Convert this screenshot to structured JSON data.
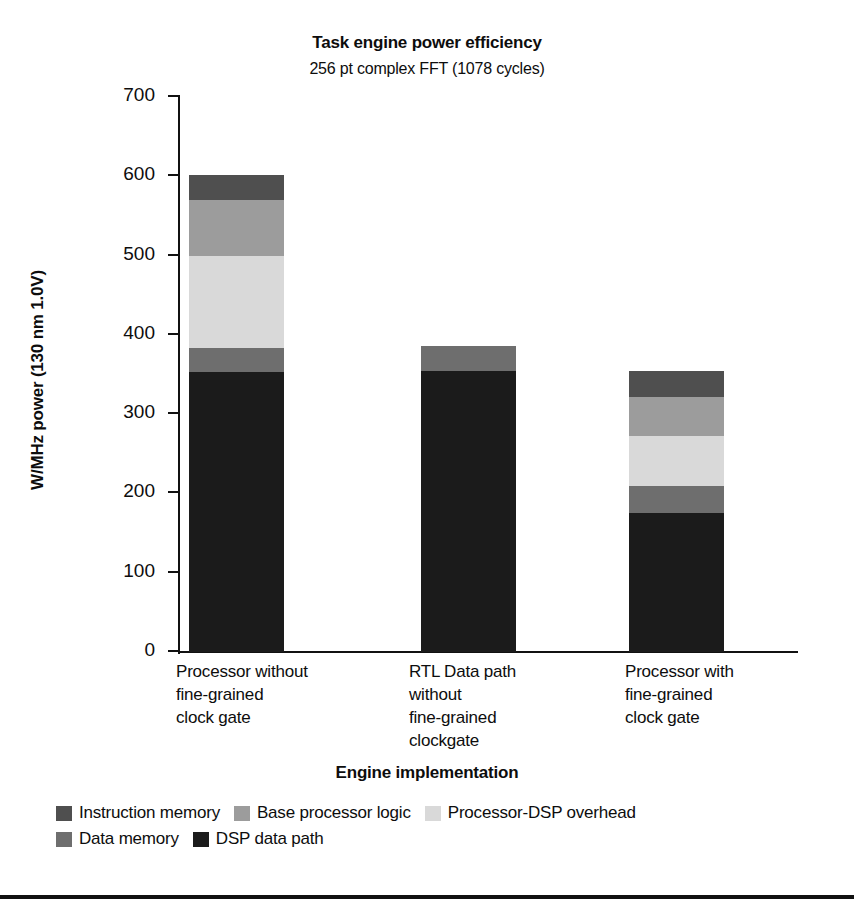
{
  "chart_data": {
    "type": "bar",
    "subtype": "stacked-vertical",
    "title": "Task engine power efficiency",
    "subtitle": "256 pt complex FFT (1078 cycles)",
    "xlabel": "Engine implementation",
    "ylabel": "W/MHz power (130 nm 1.0V)",
    "ylim": [
      0,
      700
    ],
    "yticks": [
      0,
      100,
      200,
      300,
      400,
      500,
      600,
      700
    ],
    "grid": false,
    "legend_position": "bottom-left",
    "categories": [
      "Processor without\nfine-grained\nclock gate",
      "RTL Data path\nwithout\nfine-grained\nclockgate",
      "Processor with\nfine-grained\nclock gate"
    ],
    "series": [
      {
        "name": "DSP data path",
        "color": "#1b1b1b",
        "values": [
          353,
          355,
          175
        ]
      },
      {
        "name": "Data memory",
        "color": "#6e6e6e",
        "values": [
          31,
          31,
          35
        ]
      },
      {
        "name": "Processor-DSP overhead",
        "color": "#d9d9d9",
        "values": [
          116,
          0,
          62
        ]
      },
      {
        "name": "Base processor logic",
        "color": "#9c9c9c",
        "values": [
          70,
          0,
          50
        ]
      },
      {
        "name": "Instruction memory",
        "color": "#4f4f4f",
        "values": [
          32,
          0,
          33
        ]
      }
    ],
    "totals": [
      602,
      386,
      355
    ],
    "legend_order": [
      "Instruction memory",
      "Base processor logic",
      "Processor-DSP overhead",
      "Data memory",
      "DSP data path"
    ]
  }
}
